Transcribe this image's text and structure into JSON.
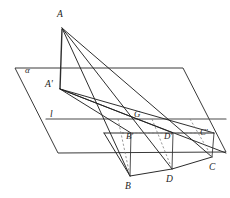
{
  "figure": {
    "canvas": {
      "width": 230,
      "height": 198
    },
    "background_color": "#ffffff",
    "stroke_color": "#2e2e2e",
    "dashed_color": "#7f7f7f",
    "labels": {
      "apex": "A",
      "apex_projection": "A'",
      "plane": "α",
      "line": "l",
      "intersection": "G",
      "b_prime": "B'",
      "d_prime": "D'",
      "c_prime": "C'",
      "b": "B",
      "d": "D",
      "c": "C"
    },
    "points": {
      "A": {
        "x": 62,
        "y": 27
      },
      "Ap": {
        "x": 60,
        "y": 89
      },
      "G": {
        "x": 140,
        "y": 120
      },
      "Bp": {
        "x": 131,
        "y": 132
      },
      "Dp": {
        "x": 173,
        "y": 132
      },
      "Cp": {
        "x": 213,
        "y": 132
      },
      "B": {
        "x": 130,
        "y": 176
      },
      "D": {
        "x": 172,
        "y": 169
      },
      "C": {
        "x": 212,
        "y": 157
      }
    },
    "plane_alpha": {
      "corners": [
        {
          "x": 15,
          "y": 68
        },
        {
          "x": 183,
          "y": 68
        },
        {
          "x": 226,
          "y": 152
        },
        {
          "x": 58,
          "y": 153
        }
      ]
    },
    "line_l": {
      "x1": 46,
      "y1": 119,
      "x2": 226,
      "y2": 119
    },
    "label_positions": {
      "A": {
        "x": 57,
        "y": 10
      },
      "Ap": {
        "x": 45,
        "y": 80
      },
      "alpha": {
        "x": 25,
        "y": 67
      },
      "l": {
        "x": 50,
        "y": 110
      },
      "G": {
        "x": 134,
        "y": 110
      },
      "Bp": {
        "x": 127,
        "y": 132
      },
      "Dp": {
        "x": 164,
        "y": 132
      },
      "Cp": {
        "x": 200,
        "y": 129
      },
      "B": {
        "x": 125,
        "y": 183
      },
      "D": {
        "x": 166,
        "y": 176
      },
      "C": {
        "x": 209,
        "y": 164
      }
    }
  }
}
